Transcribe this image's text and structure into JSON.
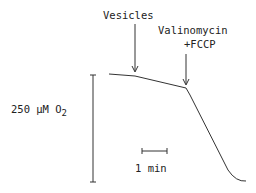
{
  "diagram": {
    "type": "oxygen-consumption-trace",
    "annotations": {
      "vesicles": "Vesicles",
      "valinomycin_line1": "Valinomycin",
      "valinomycin_line2": "+FCCP"
    },
    "y_scale_bar": {
      "value": "250 µM O",
      "subscript": "2"
    },
    "x_scale_bar": {
      "label": "1 min"
    },
    "colors": {
      "line": "#333333",
      "background": "#ffffff"
    }
  }
}
